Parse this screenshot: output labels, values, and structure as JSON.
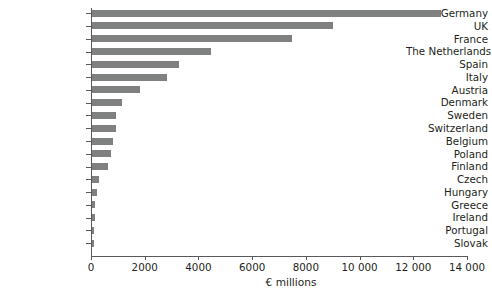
{
  "chart_data": {
    "type": "bar",
    "orientation": "horizontal",
    "title": "",
    "subtitle": "",
    "xlabel": "€ millions",
    "ylabel": "",
    "categories": [
      "Germany",
      "UK",
      "France",
      "The Netherlands",
      "Spain",
      "Italy",
      "Austria",
      "Denmark",
      "Sweden",
      "Switzerland",
      "Belgium",
      "Poland",
      "Finland",
      "Czech",
      "Hungary",
      "Greece",
      "Ireland",
      "Portugal",
      "Slovak"
    ],
    "values": [
      13000,
      8970,
      7450,
      4430,
      3240,
      2790,
      1790,
      1120,
      890,
      890,
      780,
      710,
      600,
      260,
      190,
      110,
      100,
      90,
      70
    ],
    "xlim": [
      0,
      14000
    ],
    "xticks": [
      0,
      2000,
      4000,
      6000,
      8000,
      10000,
      12000,
      14000
    ],
    "xtick_labels": [
      "0",
      "2000",
      "4000",
      "6000",
      "8000",
      "10 000",
      "12 000",
      "14 000"
    ],
    "grid": false,
    "legend": null,
    "legend_position": "none",
    "bar_color": "#7f8080",
    "axis_color": "#58595b",
    "text_color": "#231f20",
    "background_color": "#ffffff"
  }
}
